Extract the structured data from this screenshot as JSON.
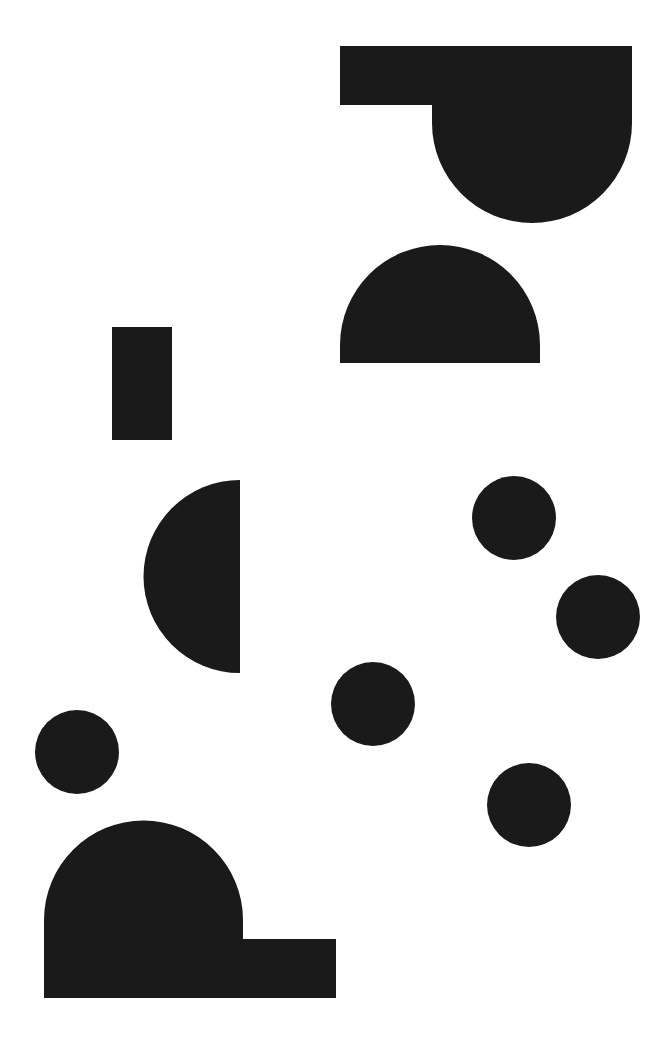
{
  "canvas": {
    "width": 672,
    "height": 1045,
    "background": "#ffffff"
  },
  "colors": {
    "fill": "#1a1a1a"
  },
  "shapes": [
    {
      "name": "top-rect-with-dome",
      "type": "composite"
    },
    {
      "name": "top-semicircle",
      "type": "semicircle"
    },
    {
      "name": "small-rectangle",
      "type": "rect"
    },
    {
      "name": "left-half-disc",
      "type": "half-disc"
    },
    {
      "name": "circle-1",
      "type": "circle"
    },
    {
      "name": "circle-2",
      "type": "circle"
    },
    {
      "name": "circle-3",
      "type": "circle"
    },
    {
      "name": "circle-4",
      "type": "circle"
    },
    {
      "name": "circle-5",
      "type": "circle"
    },
    {
      "name": "bottom-dome-with-rect",
      "type": "composite"
    }
  ]
}
